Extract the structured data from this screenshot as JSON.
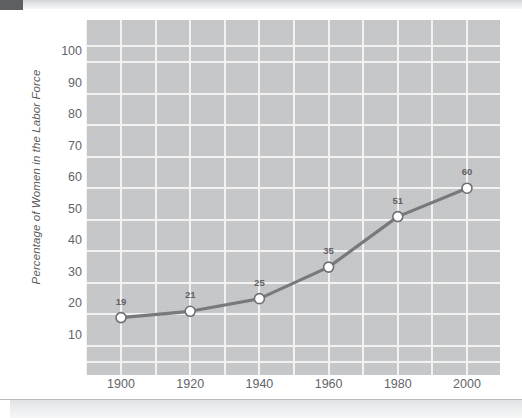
{
  "page": {
    "background_color": "#ffffff",
    "top_bar_color": "#e3e4e6",
    "corner_block_color": "#5d5f62",
    "bottom_band_color": "#ebecee"
  },
  "chart_data": {
    "type": "line",
    "title": "",
    "xlabel": "",
    "ylabel": "Percentage of Women in the Labor Force",
    "categories": [
      "1900",
      "1920",
      "1940",
      "1960",
      "1980",
      "2000"
    ],
    "x": [
      1900,
      1920,
      1940,
      1960,
      1980,
      2000
    ],
    "values": [
      19,
      21,
      25,
      35,
      51,
      60
    ],
    "point_labels": [
      "19",
      "21",
      "25",
      "35",
      "51",
      "60"
    ],
    "ytick_labels": [
      "100",
      "90",
      "80",
      "70",
      "60",
      "50",
      "40",
      "30",
      "20",
      "10"
    ],
    "ytick_values": [
      100,
      90,
      80,
      70,
      60,
      50,
      40,
      30,
      20,
      10
    ],
    "xtick_labels": [
      "1900",
      "1920",
      "1940",
      "1960",
      "1980",
      "2000"
    ],
    "ylim": [
      0,
      112
    ],
    "xlim": [
      1890,
      2010
    ],
    "grid": true,
    "legend": "none",
    "plot_background_color": "#c6c7c9",
    "gridline_color": "#f2f2f3",
    "line_color": "#78797d",
    "marker_fill_color": "#ffffff",
    "marker_edge_color": "#6e7074",
    "label_text_color": "#5f6165"
  }
}
